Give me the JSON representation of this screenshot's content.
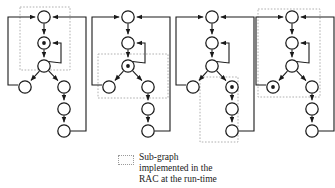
{
  "figure": {
    "type": "diagram",
    "node_radius": 6.2,
    "marker_radius": 1.9,
    "stroke_color": "#1a1a1a",
    "node_fill": "#ffffff",
    "subgraph_box_color": "#b0b0b0",
    "graphs": [
      {
        "id": "graph-1",
        "origin_x": 8,
        "origin_y": 6,
        "marked_node": "n2",
        "box": {
          "x": 20,
          "y": 7,
          "w": 50,
          "h": 63
        },
        "nodes": [
          {
            "id": "n1",
            "x": 44,
            "y": 17
          },
          {
            "id": "n2",
            "x": 44,
            "y": 43
          },
          {
            "id": "n3",
            "x": 44,
            "y": 66
          },
          {
            "id": "n4",
            "x": 25,
            "y": 87
          },
          {
            "id": "n5",
            "x": 64,
            "y": 87
          },
          {
            "id": "n6",
            "x": 64,
            "y": 109
          },
          {
            "id": "n7",
            "x": 64,
            "y": 131
          }
        ]
      },
      {
        "id": "graph-2",
        "origin_x": 92,
        "origin_y": 6,
        "marked_node": "n3",
        "box": {
          "x": 98,
          "y": 54,
          "w": 70,
          "h": 44
        },
        "nodes": [
          {
            "id": "n1",
            "x": 128,
            "y": 17
          },
          {
            "id": "n2",
            "x": 128,
            "y": 43
          },
          {
            "id": "n3",
            "x": 128,
            "y": 66
          },
          {
            "id": "n4",
            "x": 109,
            "y": 87
          },
          {
            "id": "n5",
            "x": 148,
            "y": 87
          },
          {
            "id": "n6",
            "x": 148,
            "y": 109
          },
          {
            "id": "n7",
            "x": 148,
            "y": 131
          }
        ]
      },
      {
        "id": "graph-3",
        "origin_x": 176,
        "origin_y": 6,
        "marked_node": "n5",
        "box": {
          "x": 200,
          "y": 77,
          "w": 38,
          "h": 65
        },
        "nodes": [
          {
            "id": "n1",
            "x": 212,
            "y": 17
          },
          {
            "id": "n2",
            "x": 212,
            "y": 43
          },
          {
            "id": "n3",
            "x": 212,
            "y": 66
          },
          {
            "id": "n4",
            "x": 193,
            "y": 87
          },
          {
            "id": "n5",
            "x": 232,
            "y": 87
          },
          {
            "id": "n6",
            "x": 232,
            "y": 109
          },
          {
            "id": "n7",
            "x": 232,
            "y": 131
          }
        ]
      },
      {
        "id": "graph-4",
        "origin_x": 256,
        "origin_y": 6,
        "marked_node": "n4",
        "box": {
          "x": 258,
          "y": 9,
          "w": 62,
          "h": 88
        },
        "nodes": [
          {
            "id": "n1",
            "x": 292,
            "y": 17
          },
          {
            "id": "n2",
            "x": 292,
            "y": 43
          },
          {
            "id": "n3",
            "x": 292,
            "y": 66
          },
          {
            "id": "n4",
            "x": 273,
            "y": 87
          },
          {
            "id": "n5",
            "x": 312,
            "y": 87
          },
          {
            "id": "n6",
            "x": 312,
            "y": 109
          },
          {
            "id": "n7",
            "x": 312,
            "y": 131
          }
        ]
      }
    ]
  },
  "legend": {
    "swatch": "dotted-box-swatch",
    "text": "Sub-graph\nimplemented in the\nRAC at the run-time"
  }
}
